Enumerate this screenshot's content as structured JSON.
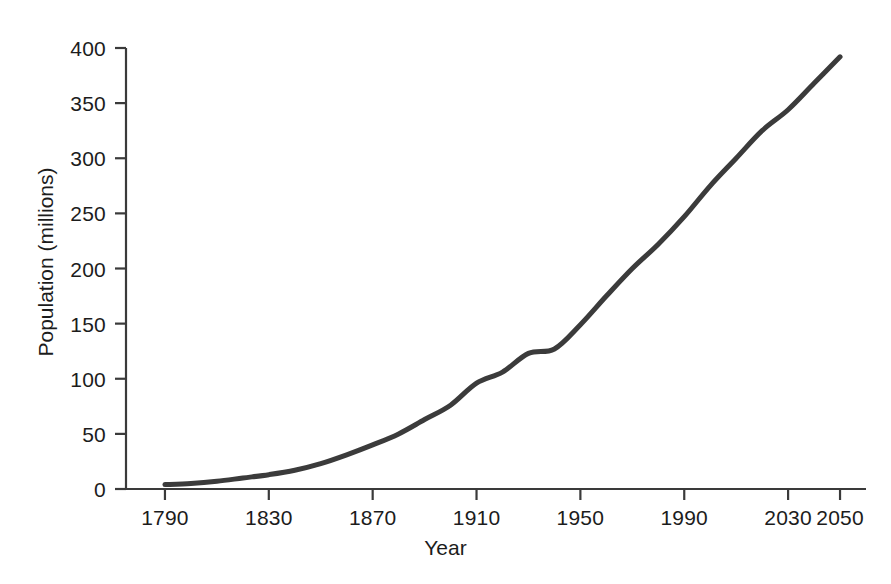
{
  "chart_data": {
    "type": "line",
    "title": "",
    "xlabel": "Year",
    "ylabel": "Population (millions)",
    "xlim": [
      1775,
      2060
    ],
    "ylim": [
      0,
      400
    ],
    "grid": false,
    "legend": "none",
    "line_color": "#3b3b3b",
    "axis_color": "#3a3a3a",
    "background_color": "#ffffff",
    "xticks": [
      1790,
      1830,
      1870,
      1910,
      1950,
      1990,
      2030,
      2050
    ],
    "xtick_labels": [
      "1790",
      "1830",
      "1870",
      "1910",
      "1950",
      "1990",
      "2030",
      "2050"
    ],
    "yticks": [
      0,
      50,
      100,
      150,
      200,
      250,
      300,
      350,
      400
    ],
    "ytick_labels": [
      "0",
      "50",
      "100",
      "150",
      "200",
      "250",
      "300",
      "350",
      "400"
    ],
    "series": [
      {
        "name": "Population",
        "x": [
          1790,
          1800,
          1810,
          1820,
          1830,
          1840,
          1850,
          1860,
          1870,
          1880,
          1890,
          1900,
          1910,
          1920,
          1930,
          1940,
          1950,
          1960,
          1970,
          1980,
          1990,
          2000,
          2010,
          2020,
          2030,
          2040,
          2050
        ],
        "values": [
          4,
          5,
          7,
          10,
          13,
          17,
          23,
          31,
          40,
          50,
          63,
          76,
          96,
          106,
          123,
          127,
          149,
          175,
          200,
          222,
          247,
          275,
          300,
          325,
          344,
          368,
          392
        ]
      }
    ]
  },
  "axis": {
    "x_title": "Year",
    "y_title": "Population (millions)"
  }
}
